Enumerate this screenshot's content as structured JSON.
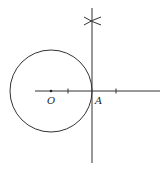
{
  "diagram": {
    "type": "geometric-construction",
    "labels": {
      "center": "O",
      "tangent_point": "A"
    },
    "circle": {
      "cx": 51,
      "cy": 91,
      "r": 41
    },
    "horizontal_line": {
      "x1": 35,
      "y1": 91,
      "x2": 160,
      "y2": 91
    },
    "tangent_line": {
      "x1": 92,
      "y1": 8,
      "x2": 92,
      "y2": 163
    },
    "tick_marks": [
      68,
      116
    ],
    "arc_marks": {
      "x": 92,
      "y": 21
    },
    "colors": {
      "line": "#333333",
      "background": "#ffffff"
    }
  }
}
